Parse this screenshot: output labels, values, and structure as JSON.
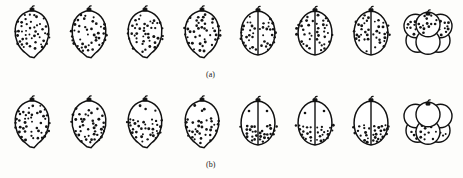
{
  "figure": {
    "type": "embryology-cleavage-diagram",
    "background_color": "#fdfdfb",
    "ink_color": "#141414",
    "stage_count_per_row": 8,
    "rows": [
      {
        "id": "a",
        "label": "(a)",
        "granule_pattern": "uniform",
        "stages": [
          {
            "name": "uncleaved-egg",
            "divisions": 0,
            "granules": 46,
            "granule_zone": "whole"
          },
          {
            "name": "uncleaved-egg",
            "divisions": 0,
            "granules": 44,
            "granule_zone": "whole"
          },
          {
            "name": "uncleaved-egg",
            "divisions": 0,
            "granules": 45,
            "granule_zone": "whole"
          },
          {
            "name": "uncleaved-egg",
            "divisions": 0,
            "granules": 43,
            "granule_zone": "whole"
          },
          {
            "name": "two-cell",
            "divisions": 1,
            "granules": 42,
            "granule_zone": "whole"
          },
          {
            "name": "two-cell",
            "divisions": 1,
            "granules": 40,
            "granule_zone": "whole"
          },
          {
            "name": "two-cell",
            "divisions": 1,
            "granules": 40,
            "granule_zone": "whole"
          },
          {
            "name": "four-cell",
            "divisions": 2,
            "granules": 38,
            "granule_zone": "animal"
          }
        ]
      },
      {
        "id": "b",
        "label": "(b)",
        "granule_pattern": "sedimenting-to-vegetal-pole",
        "stages": [
          {
            "name": "uncleaved-egg",
            "divisions": 0,
            "granules": 46,
            "granule_zone": "whole"
          },
          {
            "name": "uncleaved-egg",
            "divisions": 0,
            "granules": 40,
            "granule_zone": "lower-two-thirds"
          },
          {
            "name": "uncleaved-egg",
            "divisions": 0,
            "granules": 36,
            "granule_zone": "lower-half"
          },
          {
            "name": "uncleaved-egg",
            "divisions": 0,
            "granules": 32,
            "granule_zone": "lower-half"
          },
          {
            "name": "two-cell",
            "divisions": 1,
            "granules": 30,
            "granule_zone": "vegetal"
          },
          {
            "name": "two-cell",
            "divisions": 1,
            "granules": 30,
            "granule_zone": "vegetal"
          },
          {
            "name": "two-cell",
            "divisions": 1,
            "granules": 32,
            "granule_zone": "vegetal"
          },
          {
            "name": "four-cell",
            "divisions": 2,
            "granules": 34,
            "granule_zone": "vegetal"
          }
        ]
      }
    ]
  }
}
